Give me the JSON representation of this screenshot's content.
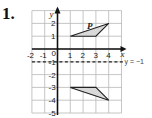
{
  "question": {
    "number": "1."
  },
  "grid": {
    "x_min": -2,
    "x_max": 5,
    "y_min": -5,
    "y_max": 3,
    "x_tick_labels": [
      "-2",
      "-1",
      "0",
      "1",
      "2",
      "3",
      "4"
    ],
    "y_tick_labels": [
      "2",
      "1",
      "-1",
      "-2",
      "-3",
      "-4",
      "-5"
    ],
    "x_axis_label": "x",
    "y_axis_label": "y"
  },
  "shapes": {
    "original": {
      "label": "P",
      "vertices": [
        [
          1,
          1
        ],
        [
          3,
          1
        ],
        [
          4,
          2
        ]
      ],
      "fill": "#d9d9d9"
    },
    "image": {
      "label": "",
      "vertices": [
        [
          1,
          -3
        ],
        [
          3,
          -3
        ],
        [
          4,
          -4
        ]
      ],
      "fill": "#d9d9d9"
    }
  },
  "mirror_line": {
    "label": "y = −1",
    "y": -1,
    "style": "dashed"
  }
}
